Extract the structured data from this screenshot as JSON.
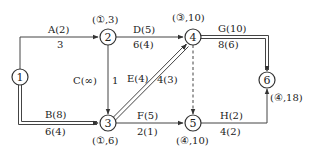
{
  "diagram": {
    "type": "network-planning-diagram",
    "nodes": [
      {
        "id": "1",
        "label": "1",
        "annotation": ""
      },
      {
        "id": "2",
        "label": "2",
        "annotation": "(①,3)"
      },
      {
        "id": "3",
        "label": "3",
        "annotation": "(①,6)"
      },
      {
        "id": "4",
        "label": "4",
        "annotation": "(③,10)"
      },
      {
        "id": "5",
        "label": "5",
        "annotation": "(④,10)"
      },
      {
        "id": "6",
        "label": "6",
        "annotation": "(④,18)"
      }
    ],
    "edges": [
      {
        "from": "1",
        "to": "2",
        "top": "A(2)",
        "bottom": "3",
        "critical": false
      },
      {
        "from": "1",
        "to": "3",
        "top": "B(8)",
        "bottom": "6(4)",
        "critical": true
      },
      {
        "from": "2",
        "to": "3",
        "top": "C(∞)",
        "bottom": "1",
        "critical": false
      },
      {
        "from": "2",
        "to": "4",
        "top": "D(5)",
        "bottom": "6(4)",
        "critical": false
      },
      {
        "from": "3",
        "to": "4",
        "top": "E(4)",
        "bottom": "4(3)",
        "critical": true
      },
      {
        "from": "3",
        "to": "5",
        "top": "F(5)",
        "bottom": "2(1)",
        "critical": false
      },
      {
        "from": "4",
        "to": "5",
        "top": "",
        "bottom": "",
        "critical": false,
        "dummy": true
      },
      {
        "from": "4",
        "to": "6",
        "top": "G(10)",
        "bottom": "8(6)",
        "critical": true
      },
      {
        "from": "5",
        "to": "6",
        "top": "H(2)",
        "bottom": "4(2)",
        "critical": false
      }
    ]
  }
}
